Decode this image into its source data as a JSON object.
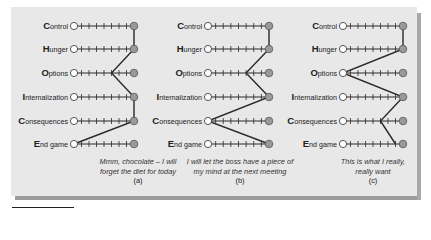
{
  "rows": [
    {
      "initial": "C",
      "rest": "ontrol"
    },
    {
      "initial": "H",
      "rest": "unger"
    },
    {
      "initial": "O",
      "rest": "ptions"
    },
    {
      "initial": "I",
      "rest": "nternalization"
    },
    {
      "initial": "C",
      "rest": "onsequences"
    },
    {
      "initial": "E",
      "rest": "nd game"
    }
  ],
  "scale": {
    "min": 0,
    "max": 8,
    "ticks_between": 7
  },
  "panels": [
    {
      "id": "a",
      "tag": "(a)",
      "caption_line1": "Mmm, chocolate – I will",
      "caption_line2": "forget the diet for today",
      "values": [
        8,
        8,
        5,
        8,
        8,
        0
      ]
    },
    {
      "id": "b",
      "tag": "(b)",
      "caption_line1": "I will let the boss have a piece of",
      "caption_line2": "my mind at the next meeting",
      "values": [
        8,
        8,
        5,
        8,
        0,
        8
      ]
    },
    {
      "id": "c",
      "tag": "(c)",
      "caption_line1": "This is what I really,",
      "caption_line2": "really want",
      "values": [
        8,
        8,
        0,
        8,
        5,
        7
      ]
    }
  ],
  "colors": {
    "frame": "#e8e8e8",
    "line": "#2a2a2a",
    "filled_dot": "#9a9a9a",
    "open_dot": "#ffffff"
  }
}
